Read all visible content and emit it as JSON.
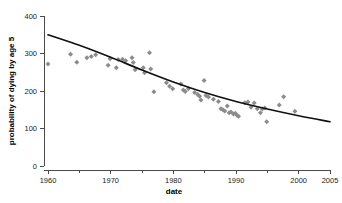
{
  "chart_data": {
    "type": "scatter",
    "title": "",
    "xlabel": "date",
    "ylabel": "probability of dying by age 5",
    "xlim": [
      1960,
      2005
    ],
    "ylim": [
      0,
      400
    ],
    "grid": false,
    "legend": "none",
    "x_ticks_major": [
      1960,
      1970,
      1980,
      1990,
      2000,
      2005
    ],
    "x_tick_labels": [
      "1960",
      "1970",
      "1980",
      "1990",
      "2000",
      "2005"
    ],
    "x_ticks_minor": [
      1965,
      1975,
      1985,
      1995
    ],
    "y_ticks_major": [
      0,
      100,
      200,
      300,
      400
    ],
    "y_tick_labels": [
      "0",
      "100",
      "200",
      "300",
      "400"
    ],
    "marker_shape": "diamond",
    "marker_color": "#8c8c8c",
    "line_color": "#111111",
    "axis_color": "#4a4a4a",
    "points": [
      {
        "x": 1960.0,
        "y": 272
      },
      {
        "x": 1963.6,
        "y": 298
      },
      {
        "x": 1964.6,
        "y": 277
      },
      {
        "x": 1966.2,
        "y": 289
      },
      {
        "x": 1966.9,
        "y": 292
      },
      {
        "x": 1967.6,
        "y": 297
      },
      {
        "x": 1969.6,
        "y": 269
      },
      {
        "x": 1969.9,
        "y": 286
      },
      {
        "x": 1970.9,
        "y": 262
      },
      {
        "x": 1971.2,
        "y": 284
      },
      {
        "x": 1971.9,
        "y": 285
      },
      {
        "x": 1972.4,
        "y": 281
      },
      {
        "x": 1973.4,
        "y": 289
      },
      {
        "x": 1973.6,
        "y": 276
      },
      {
        "x": 1973.9,
        "y": 257
      },
      {
        "x": 1975.2,
        "y": 262
      },
      {
        "x": 1975.4,
        "y": 249
      },
      {
        "x": 1976.2,
        "y": 302
      },
      {
        "x": 1976.4,
        "y": 259
      },
      {
        "x": 1976.9,
        "y": 198
      },
      {
        "x": 1978.9,
        "y": 222
      },
      {
        "x": 1979.4,
        "y": 213
      },
      {
        "x": 1979.9,
        "y": 206
      },
      {
        "x": 1981.2,
        "y": 219
      },
      {
        "x": 1981.6,
        "y": 203
      },
      {
        "x": 1981.9,
        "y": 199
      },
      {
        "x": 1982.4,
        "y": 206
      },
      {
        "x": 1983.4,
        "y": 196
      },
      {
        "x": 1983.9,
        "y": 191
      },
      {
        "x": 1984.2,
        "y": 186
      },
      {
        "x": 1984.4,
        "y": 176
      },
      {
        "x": 1984.9,
        "y": 228
      },
      {
        "x": 1985.2,
        "y": 188
      },
      {
        "x": 1985.6,
        "y": 184
      },
      {
        "x": 1986.4,
        "y": 178
      },
      {
        "x": 1987.2,
        "y": 172
      },
      {
        "x": 1987.6,
        "y": 153
      },
      {
        "x": 1987.9,
        "y": 150
      },
      {
        "x": 1988.2,
        "y": 147
      },
      {
        "x": 1988.6,
        "y": 160
      },
      {
        "x": 1988.9,
        "y": 142
      },
      {
        "x": 1989.2,
        "y": 144
      },
      {
        "x": 1989.6,
        "y": 139
      },
      {
        "x": 1989.9,
        "y": 141
      },
      {
        "x": 1990.2,
        "y": 135
      },
      {
        "x": 1990.4,
        "y": 133
      },
      {
        "x": 1991.4,
        "y": 169
      },
      {
        "x": 1991.9,
        "y": 171
      },
      {
        "x": 1992.4,
        "y": 157
      },
      {
        "x": 1992.9,
        "y": 168
      },
      {
        "x": 1993.4,
        "y": 153
      },
      {
        "x": 1993.9,
        "y": 142
      },
      {
        "x": 1994.2,
        "y": 152
      },
      {
        "x": 1994.6,
        "y": 155
      },
      {
        "x": 1994.9,
        "y": 118
      },
      {
        "x": 1996.9,
        "y": 163
      },
      {
        "x": 1997.6,
        "y": 185
      },
      {
        "x": 1999.4,
        "y": 146
      }
    ],
    "trend_line": {
      "description": "smoothed declining curve",
      "points": [
        {
          "x": 1960.0,
          "y": 350
        },
        {
          "x": 1965.0,
          "y": 322
        },
        {
          "x": 1970.0,
          "y": 290
        },
        {
          "x": 1975.0,
          "y": 256
        },
        {
          "x": 1980.0,
          "y": 224
        },
        {
          "x": 1985.0,
          "y": 196
        },
        {
          "x": 1990.0,
          "y": 172
        },
        {
          "x": 1995.0,
          "y": 152
        },
        {
          "x": 2000.0,
          "y": 134
        },
        {
          "x": 2005.0,
          "y": 118
        }
      ]
    }
  }
}
